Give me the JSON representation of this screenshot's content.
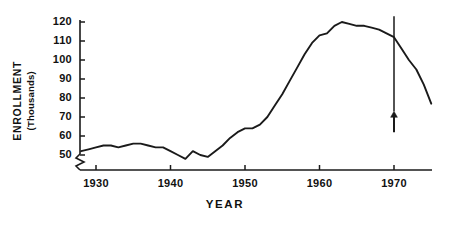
{
  "chart_data": {
    "type": "line",
    "title": "",
    "xlabel": "YEAR",
    "ylabel": "ENROLLMENT (Thousands)",
    "ylabel_main": "ENROLLMENT",
    "ylabel_sub": "(Thousands)",
    "xlim": [
      1928,
      1975
    ],
    "ylim": [
      45,
      123
    ],
    "yticks": [
      50,
      60,
      70,
      80,
      90,
      100,
      110,
      120
    ],
    "ytick_labels": [
      "50",
      "60",
      "70",
      "80",
      "90",
      "100",
      "110",
      "120"
    ],
    "xticks": [
      1930,
      1940,
      1950,
      1960,
      1970
    ],
    "xtick_labels": [
      "1930",
      "1940",
      "1950",
      "1960",
      "1970"
    ],
    "grid": false,
    "legend": null,
    "y_axis_break": true,
    "line_color": "#1a1a1a",
    "axis_color": "#1a1a1a",
    "x": [
      1928,
      1929,
      1930,
      1931,
      1932,
      1933,
      1934,
      1935,
      1936,
      1937,
      1938,
      1939,
      1940,
      1941,
      1942,
      1943,
      1944,
      1945,
      1946,
      1947,
      1948,
      1949,
      1950,
      1951,
      1952,
      1953,
      1954,
      1955,
      1956,
      1957,
      1958,
      1959,
      1960,
      1961,
      1962,
      1963,
      1964,
      1965,
      1966,
      1967,
      1968,
      1969,
      1970,
      1971,
      1972,
      1973,
      1974,
      1975
    ],
    "values": [
      52,
      53,
      54,
      55,
      55,
      54,
      55,
      56,
      56,
      55,
      54,
      54,
      52,
      50,
      48,
      52,
      50,
      49,
      52,
      55,
      59,
      62,
      64,
      64,
      66,
      70,
      76,
      82,
      89,
      96,
      103,
      109,
      113,
      114,
      118,
      120,
      119,
      118,
      118,
      117,
      116,
      114,
      112,
      106,
      100,
      95,
      87,
      77
    ],
    "annotations": [
      {
        "name": "reference-line-1970",
        "type": "vertical-line",
        "x": 1970,
        "y_top": 123,
        "y_bottom": 73
      },
      {
        "name": "up-arrow-1970",
        "type": "arrow-up",
        "x": 1970,
        "y_tail": 62,
        "y_head": 73
      }
    ]
  }
}
